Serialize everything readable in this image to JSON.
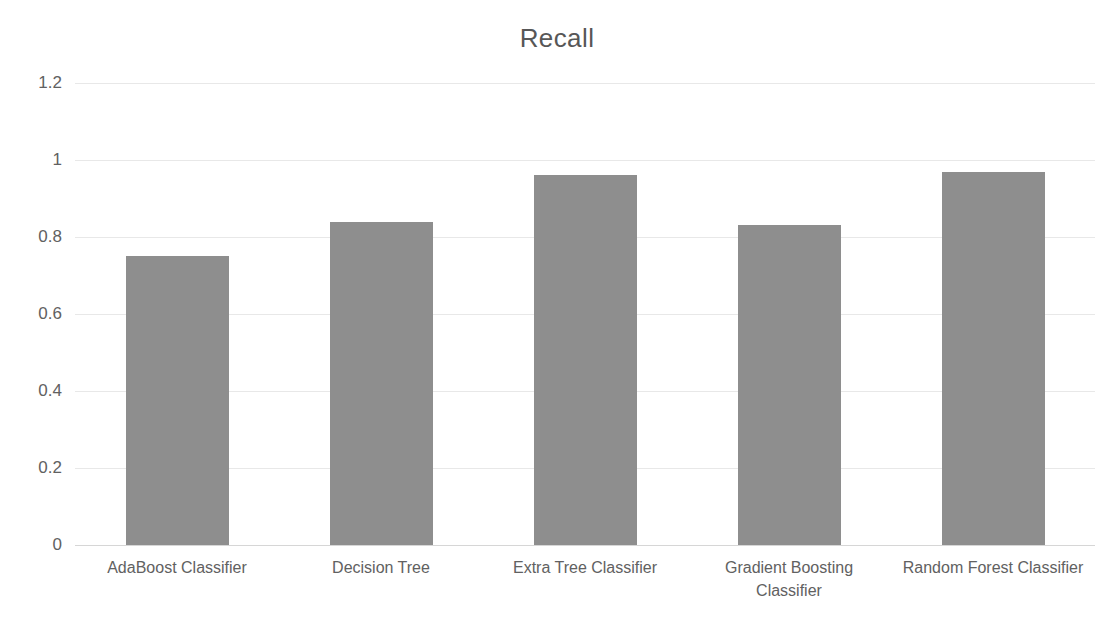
{
  "chart_data": {
    "type": "bar",
    "title": "Recall",
    "xlabel": "",
    "ylabel": "",
    "categories": [
      "AdaBoost Classifier",
      "Decision Tree",
      "Extra Tree Classifier",
      "Gradient Boosting Classifier",
      "Random Forest Classifier"
    ],
    "values": [
      0.75,
      0.84,
      0.96,
      0.83,
      0.97
    ],
    "ylim": [
      0,
      1.2
    ],
    "yticks": [
      0,
      0.2,
      0.4,
      0.6,
      0.8,
      1,
      1.2
    ],
    "ytick_labels": [
      "0",
      "0.2",
      "0.4",
      "0.6",
      "0.8",
      "1",
      "1.2"
    ],
    "grid": true,
    "legend": false,
    "bar_color": "#8e8e8e",
    "gridline_color": "#e8e8e8",
    "text_color": "#616161",
    "title_color": "#575757",
    "background_color": "#ffffff"
  }
}
